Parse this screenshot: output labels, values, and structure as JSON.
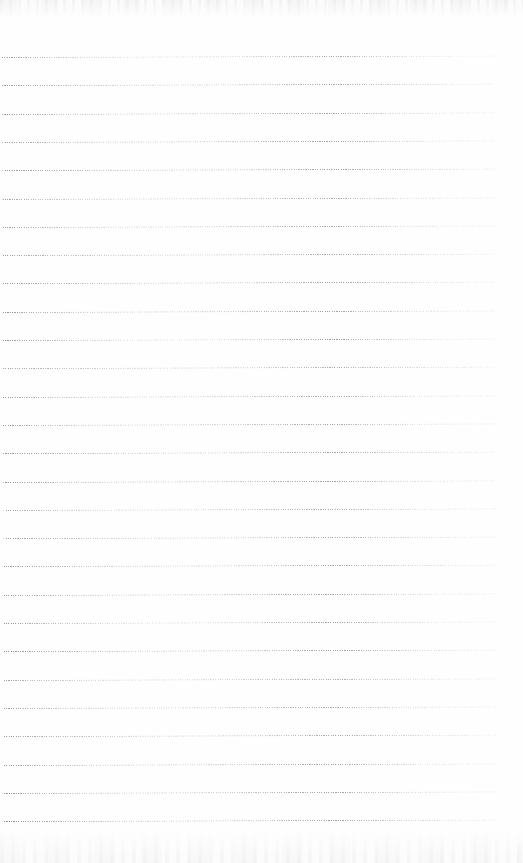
{
  "document": {
    "kind": "scanned-lined-paper",
    "title": "Blank ruled notebook page",
    "written_text": "",
    "page_width": 523,
    "page_height": 863,
    "background_color": "#fefefe",
    "has_handwriting": false,
    "has_printed_text": false
  },
  "ruling": {
    "style": "dotted",
    "line_color": "#8d8d93",
    "line_count": 28,
    "first_line_y": 57,
    "line_spacing": 28.3,
    "line_start_x": 3,
    "line_end_x": 497,
    "skew_degrees": -0.16
  },
  "artifacts": {
    "top_noise_band_height": 16,
    "bottom_noise_band_height": 32,
    "noise_color": "#96969b"
  },
  "lines": [
    {
      "index": 1,
      "content": ""
    },
    {
      "index": 2,
      "content": ""
    },
    {
      "index": 3,
      "content": ""
    },
    {
      "index": 4,
      "content": ""
    },
    {
      "index": 5,
      "content": ""
    },
    {
      "index": 6,
      "content": ""
    },
    {
      "index": 7,
      "content": ""
    },
    {
      "index": 8,
      "content": ""
    },
    {
      "index": 9,
      "content": ""
    },
    {
      "index": 10,
      "content": ""
    },
    {
      "index": 11,
      "content": ""
    },
    {
      "index": 12,
      "content": ""
    },
    {
      "index": 13,
      "content": ""
    },
    {
      "index": 14,
      "content": ""
    },
    {
      "index": 15,
      "content": ""
    },
    {
      "index": 16,
      "content": ""
    },
    {
      "index": 17,
      "content": ""
    },
    {
      "index": 18,
      "content": ""
    },
    {
      "index": 19,
      "content": ""
    },
    {
      "index": 20,
      "content": ""
    },
    {
      "index": 21,
      "content": ""
    },
    {
      "index": 22,
      "content": ""
    },
    {
      "index": 23,
      "content": ""
    },
    {
      "index": 24,
      "content": ""
    },
    {
      "index": 25,
      "content": ""
    },
    {
      "index": 26,
      "content": ""
    },
    {
      "index": 27,
      "content": ""
    },
    {
      "index": 28,
      "content": ""
    }
  ]
}
